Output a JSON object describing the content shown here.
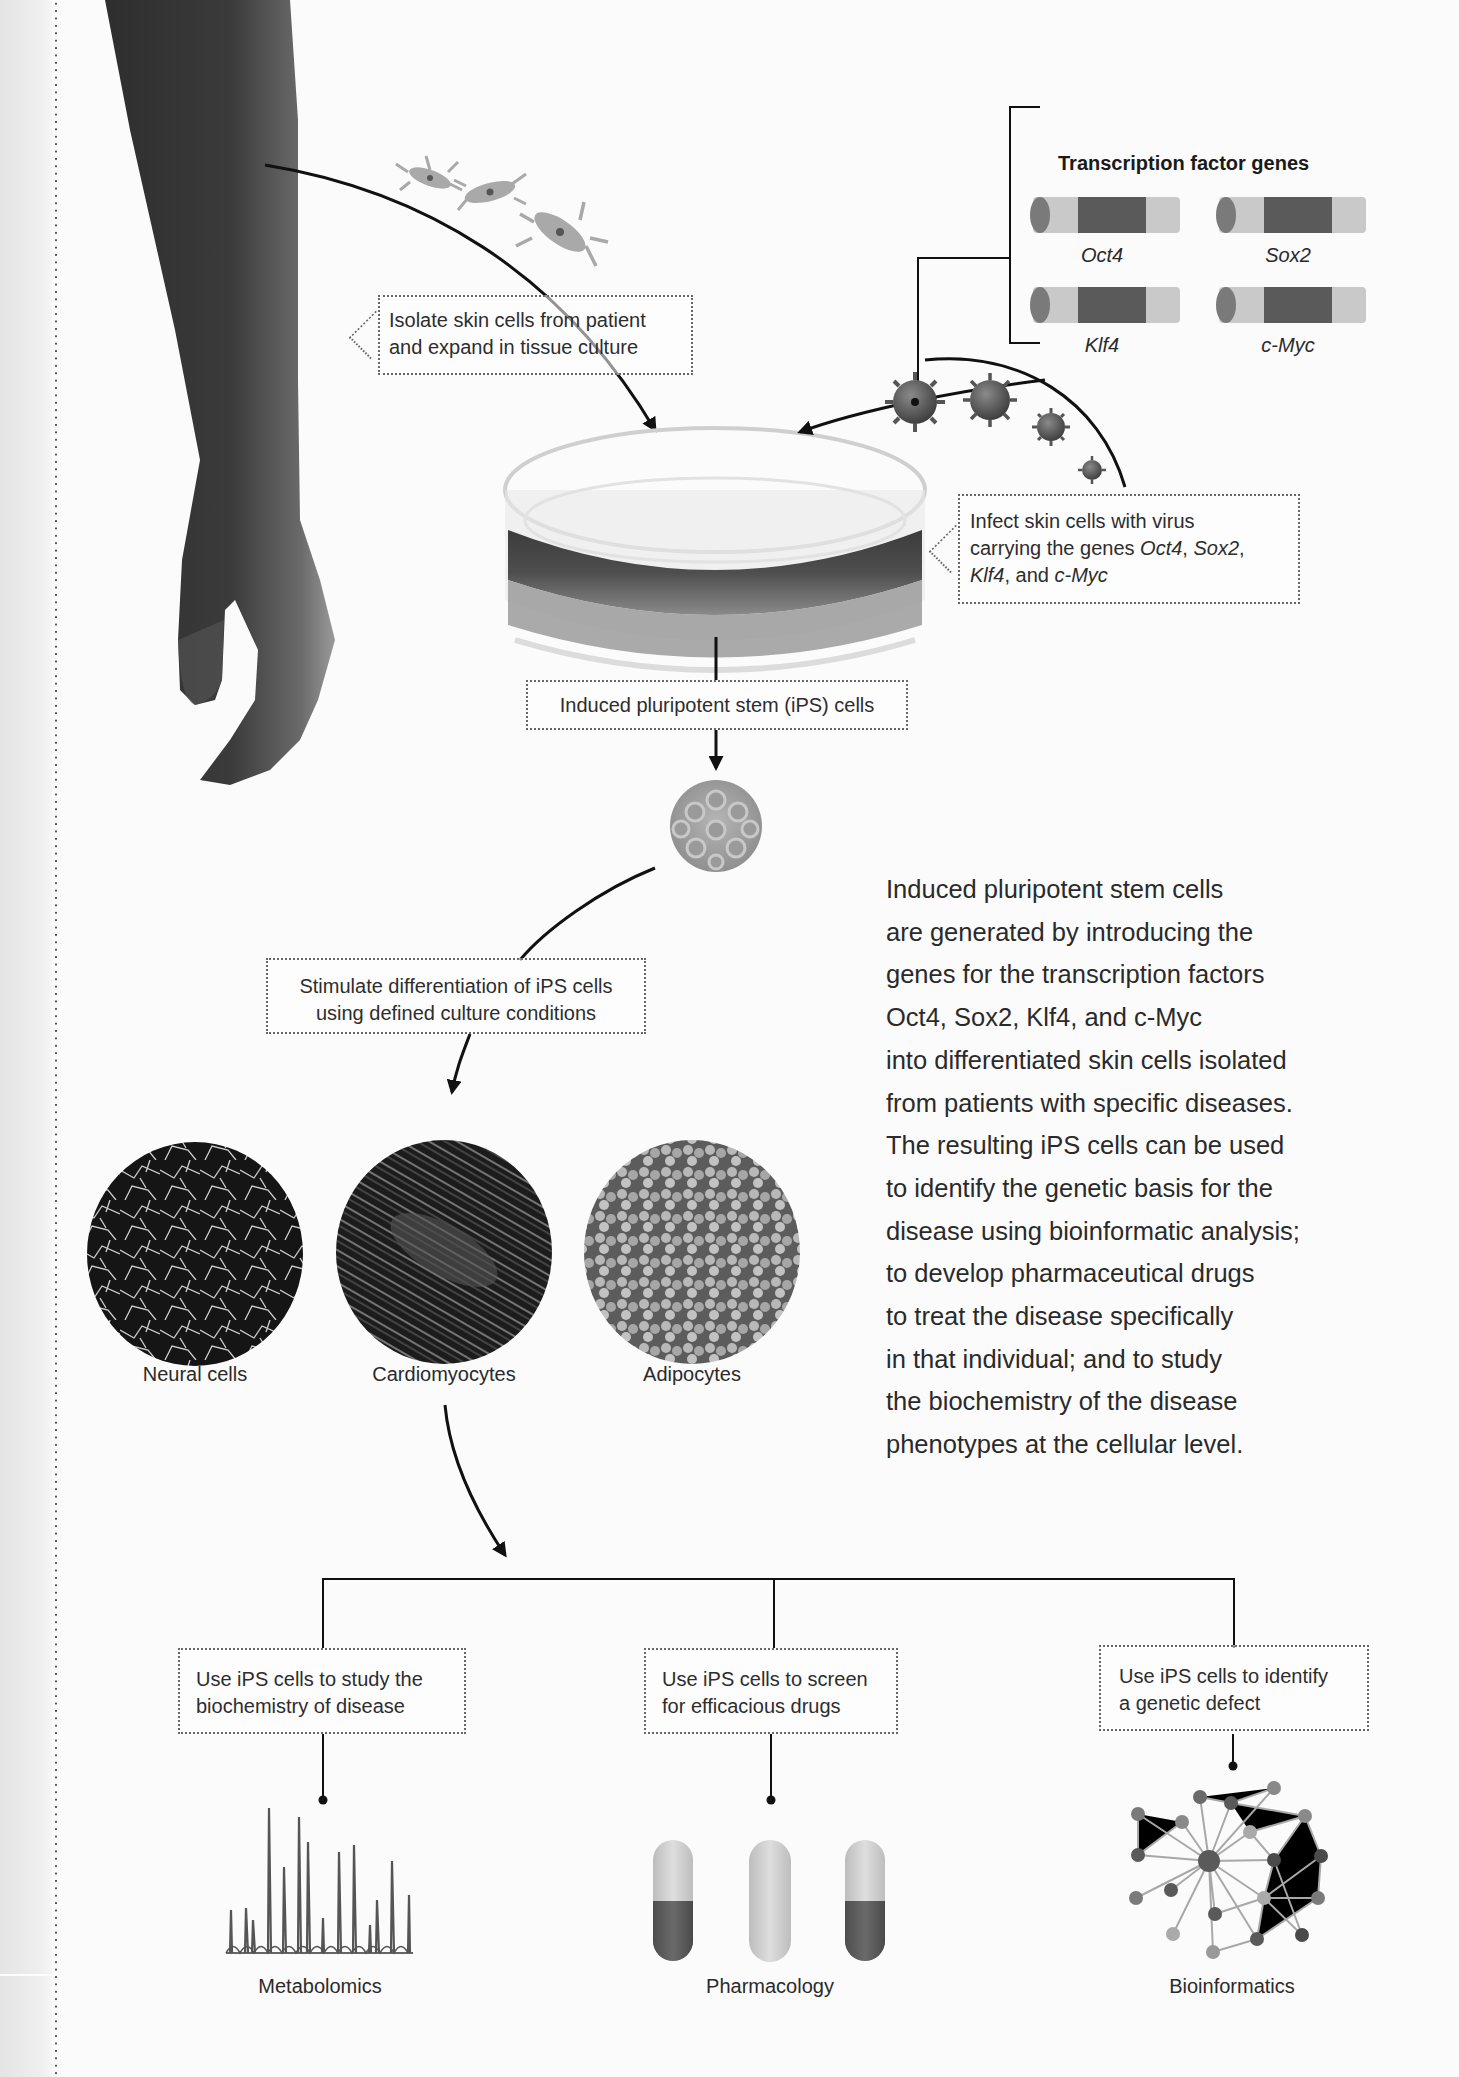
{
  "figure": {
    "gene_panel": {
      "title": "Transcription factor genes",
      "genes": [
        {
          "name": "Oct4"
        },
        {
          "name": "Sox2"
        },
        {
          "name": "Klf4"
        },
        {
          "name": "c-Myc"
        }
      ]
    },
    "steps": {
      "isolate": {
        "line1": "Isolate skin cells from patient",
        "line2": "and expand in tissue culture"
      },
      "infect": {
        "line1": "Infect skin cells with virus",
        "line2_prefix": "carrying the genes ",
        "gene1": "Oct4",
        "sep1": ", ",
        "gene2": "Sox2",
        "sep2": ",",
        "gene3": "Klf4",
        "line3_mid": ", and ",
        "gene4": "c-Myc"
      },
      "ips": {
        "label": "Induced pluripotent stem (iPS) cells"
      },
      "stimulate": {
        "line1": "Stimulate differentiation of iPS cells",
        "line2": "using defined culture conditions"
      }
    },
    "cell_types": [
      {
        "label": "Neural cells"
      },
      {
        "label": "Cardiomyocytes"
      },
      {
        "label": "Adipocytes"
      }
    ],
    "uses": [
      {
        "line1": "Use iPS cells to study the",
        "line2": "biochemistry of disease",
        "result": "Metabolomics"
      },
      {
        "line1": "Use iPS cells to screen",
        "line2": "for efficacious drugs",
        "result": "Pharmacology"
      },
      {
        "line1": "Use iPS cells to identify",
        "line2": "a genetic defect",
        "result": "Bioinformatics"
      }
    ],
    "description": {
      "lines": [
        "Induced pluripotent stem cells",
        "are generated by introducing the",
        "genes for the transcription factors",
        "Oct4, Sox2, Klf4, and c-Myc",
        "into differentiated skin cells isolated",
        "from patients with specific diseases.",
        "The resulting iPS cells can be used",
        "to identify the genetic basis for the",
        "disease using bioinformatic analysis;",
        "to develop pharmaceutical drugs",
        "to treat the disease specifically",
        "in that individual; and to study",
        "the biochemistry of the disease",
        "phenotypes at the cellular level."
      ]
    },
    "colors": {
      "line": "#111111",
      "gene_dark": "#5a5a5a",
      "gene_light": "#c9c9c9",
      "box_border": "#666666",
      "text": "#2a2a2a"
    }
  }
}
